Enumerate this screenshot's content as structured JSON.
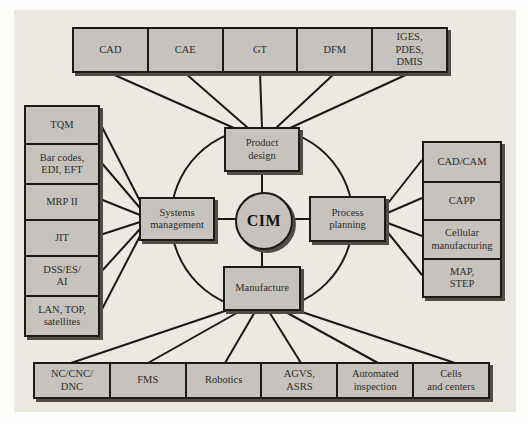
{
  "diagram": {
    "center": {
      "label": "CIM"
    },
    "hubs": {
      "top": {
        "label": "Product\ndesign"
      },
      "left": {
        "label": "Systems\nmanagement"
      },
      "right": {
        "label": "Process\nplanning"
      },
      "bottom": {
        "label": "Manufacture"
      }
    },
    "top_row": {
      "items": [
        {
          "label": "CAD"
        },
        {
          "label": "CAE"
        },
        {
          "label": "GT"
        },
        {
          "label": "DFM"
        },
        {
          "label": "IGES,\nPDES,\nDMIS"
        }
      ]
    },
    "left_column": {
      "items": [
        {
          "label": "TQM"
        },
        {
          "label": "Bar codes,\nEDI, EFT"
        },
        {
          "label": "MRP II"
        },
        {
          "label": "JIT"
        },
        {
          "label": "DSS/ES/\nAI"
        },
        {
          "label": "LAN, TOP,\nsatellites"
        }
      ]
    },
    "right_column": {
      "items": [
        {
          "label": "CAD/CAM"
        },
        {
          "label": "CAPP"
        },
        {
          "label": "Cellular\nmanufacturing"
        },
        {
          "label": "MAP,\nSTEP"
        }
      ]
    },
    "bottom_row": {
      "items": [
        {
          "label": "NC/CNC/\nDNC"
        },
        {
          "label": "FMS"
        },
        {
          "label": "Robotics"
        },
        {
          "label": "AGVS,\nASRS"
        },
        {
          "label": "Automated\ninspection"
        },
        {
          "label": "Cells\nand centers"
        }
      ]
    },
    "colors": {
      "panel_bg": "#ebe9e2",
      "box_fill": "#c6c3be",
      "border": "#1c1b18",
      "shadow": "#514e47",
      "line": "#1a1917",
      "text": "#2e2c28"
    }
  }
}
